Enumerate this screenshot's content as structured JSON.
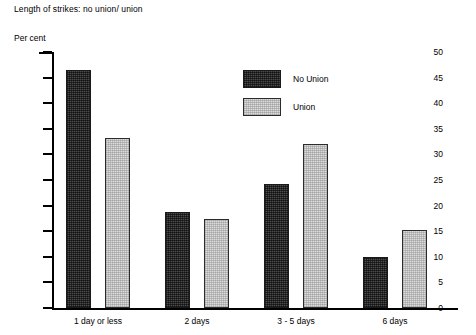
{
  "chart_data": {
    "type": "bar",
    "title": "Length of strikes: no union/ union",
    "xlabel": "",
    "ylabel": "Per cent",
    "ylim": [
      0,
      50
    ],
    "yticks": [
      0,
      5,
      10,
      15,
      20,
      25,
      30,
      35,
      40,
      45,
      50
    ],
    "grid": false,
    "legend_position": "inside-top-right",
    "categories": [
      "1 day or less",
      "2 days",
      "3 - 5 days",
      "6 days"
    ],
    "series": [
      {
        "name": "No Union",
        "color": "#4d4d4d",
        "values": [
          46.5,
          18.7,
          24.3,
          10.0
        ]
      },
      {
        "name": "Union",
        "color": "#dcdcdc",
        "values": [
          33.2,
          17.3,
          32.0,
          15.2
        ]
      }
    ]
  },
  "colors": {
    "no_union": "#4d4d4d",
    "union": "#dcdcdc",
    "axis": "#000000",
    "background": "#ffffff"
  }
}
